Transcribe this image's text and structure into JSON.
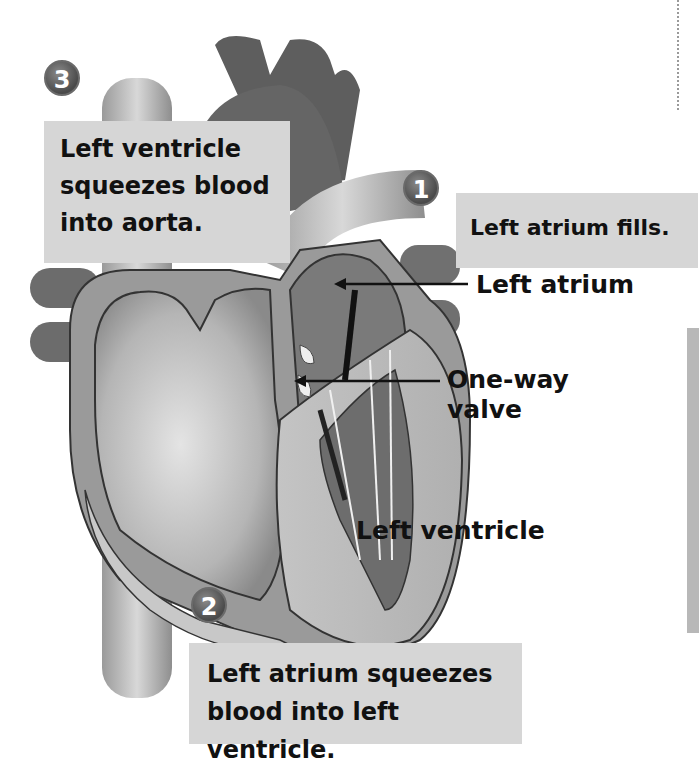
{
  "diagram": {
    "steps": [
      {
        "number": "1",
        "text": "Left atrium fills."
      },
      {
        "number": "2",
        "text_lines": [
          "Left atrium squeezes",
          "blood into left ventricle."
        ]
      },
      {
        "number": "3",
        "text_lines": [
          "Left ventricle",
          "squeezes blood",
          "into aorta."
        ]
      }
    ],
    "labels": {
      "left_atrium": "Left atrium",
      "one_way_valve_lines": [
        "One-way",
        "valve"
      ],
      "left_ventricle": "Left ventricle"
    },
    "colors": {
      "label_box": "#d6d6d6",
      "heart_dark": "#5e5e5e",
      "heart_mid": "#8c8c8c",
      "heart_light": "#c9c9c9",
      "badge": "#555555"
    }
  }
}
